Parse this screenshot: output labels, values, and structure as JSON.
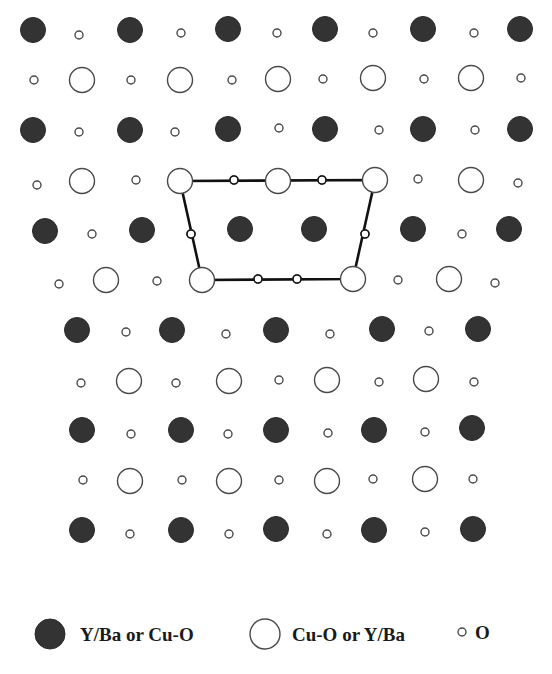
{
  "colors": {
    "filled": "#333333",
    "stroke": "#4a4a4a",
    "line": "#111111",
    "background": "#ffffff"
  },
  "radii": {
    "large": 12.5,
    "small": 4
  },
  "atoms": {
    "filled": [
      [
        33,
        30
      ],
      [
        130,
        30
      ],
      [
        228,
        29
      ],
      [
        325,
        29
      ],
      [
        423,
        29
      ],
      [
        520,
        29
      ],
      [
        33,
        130
      ],
      [
        130,
        130
      ],
      [
        228,
        129
      ],
      [
        325,
        129
      ],
      [
        423,
        129
      ],
      [
        520,
        129
      ],
      [
        45,
        231
      ],
      [
        142,
        230
      ],
      [
        240,
        229
      ],
      [
        314,
        229
      ],
      [
        413,
        229
      ],
      [
        509,
        229
      ],
      [
        77,
        330
      ],
      [
        172,
        330
      ],
      [
        276,
        330
      ],
      [
        382,
        329
      ],
      [
        478,
        329
      ],
      [
        82,
        430
      ],
      [
        181,
        430
      ],
      [
        276,
        430
      ],
      [
        374,
        430
      ],
      [
        472,
        428
      ],
      [
        82,
        530
      ],
      [
        181,
        530
      ],
      [
        276,
        529
      ],
      [
        374,
        530
      ],
      [
        473,
        529
      ]
    ],
    "open": [
      [
        82,
        80
      ],
      [
        180,
        80
      ],
      [
        278,
        79
      ],
      [
        373,
        78
      ],
      [
        471,
        78
      ],
      [
        82,
        181
      ],
      [
        180,
        181
      ],
      [
        278,
        181
      ],
      [
        375,
        180
      ],
      [
        471,
        180
      ],
      [
        106,
        280
      ],
      [
        202,
        280
      ],
      [
        353,
        279
      ],
      [
        449,
        279
      ],
      [
        129,
        381
      ],
      [
        229,
        381
      ],
      [
        327,
        380
      ],
      [
        426,
        379
      ],
      [
        130,
        481
      ],
      [
        229,
        481
      ],
      [
        327,
        481
      ],
      [
        425,
        479
      ]
    ],
    "small": [
      [
        79,
        35
      ],
      [
        181,
        33
      ],
      [
        277,
        33
      ],
      [
        373,
        33
      ],
      [
        474,
        33
      ],
      [
        34,
        80
      ],
      [
        131,
        80
      ],
      [
        232,
        80
      ],
      [
        323,
        79
      ],
      [
        424,
        79
      ],
      [
        521,
        78
      ],
      [
        79,
        132
      ],
      [
        175,
        132
      ],
      [
        279,
        128
      ],
      [
        379,
        130
      ],
      [
        475,
        130
      ],
      [
        37,
        185
      ],
      [
        136,
        180
      ],
      [
        234,
        180
      ],
      [
        322,
        180
      ],
      [
        418,
        179
      ],
      [
        518,
        183
      ],
      [
        92,
        234
      ],
      [
        191,
        234
      ],
      [
        365,
        234
      ],
      [
        462,
        234
      ],
      [
        59,
        284
      ],
      [
        157,
        281
      ],
      [
        258,
        279
      ],
      [
        297,
        279
      ],
      [
        398,
        280
      ],
      [
        495,
        283
      ],
      [
        126,
        332
      ],
      [
        226,
        334
      ],
      [
        330,
        334
      ],
      [
        429,
        331
      ],
      [
        81,
        383
      ],
      [
        176,
        383
      ],
      [
        279,
        380
      ],
      [
        379,
        382
      ],
      [
        474,
        382
      ],
      [
        131,
        434
      ],
      [
        228,
        434
      ],
      [
        328,
        433
      ],
      [
        425,
        432
      ],
      [
        83,
        480
      ],
      [
        182,
        480
      ],
      [
        279,
        480
      ],
      [
        373,
        479
      ],
      [
        473,
        479
      ],
      [
        130,
        534
      ],
      [
        229,
        534
      ],
      [
        327,
        534
      ],
      [
        425,
        532
      ]
    ]
  },
  "unit_cell": {
    "path": [
      [
        180,
        181
      ],
      [
        375,
        180
      ],
      [
        353,
        279
      ],
      [
        202,
        280
      ]
    ],
    "oxygens": [
      [
        234,
        180
      ],
      [
        322,
        180
      ],
      [
        365,
        234
      ],
      [
        297,
        279
      ],
      [
        258,
        279
      ],
      [
        191,
        234
      ]
    ]
  },
  "legend": {
    "items": [
      {
        "symbol": "filled",
        "x": 50,
        "y": 634,
        "label": "Y/Ba or Cu-O",
        "label_x": 80
      },
      {
        "symbol": "open",
        "x": 265,
        "y": 634,
        "label": "Cu-O or Y/Ba",
        "label_x": 292
      },
      {
        "symbol": "small",
        "x": 462,
        "y": 632,
        "label": "O",
        "label_x": 475
      }
    ]
  }
}
